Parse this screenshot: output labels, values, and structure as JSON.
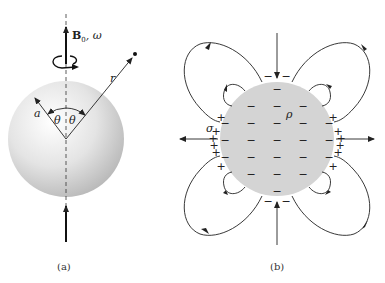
{
  "figure": {
    "panel_a": {
      "caption": "(a)",
      "field_label_B": "B",
      "field_label_sub": "0",
      "field_label_rest": ", ω",
      "radius_label": "a",
      "distance_label": "r",
      "angle_label_left": "θ",
      "angle_label_right": "θ"
    },
    "panel_b": {
      "caption": "(b)",
      "volume_charge_label": "ρ",
      "surface_charge_label": "σ",
      "minus_sign": "−",
      "plus_sign": "+"
    }
  }
}
